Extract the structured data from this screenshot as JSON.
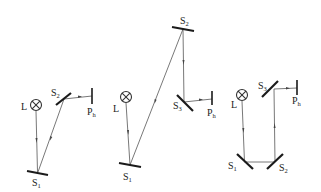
{
  "diagrams": [
    {
      "name": "two-mirror-setup",
      "labels": {
        "lamp": "L",
        "mirrors": [
          {
            "base": "S",
            "sub": "1"
          },
          {
            "base": "S",
            "sub": "2"
          }
        ],
        "detector": {
          "base": "P",
          "sub": "h"
        }
      }
    },
    {
      "name": "three-mirror-long-path-setup",
      "labels": {
        "lamp": "L",
        "mirrors": [
          {
            "base": "S",
            "sub": "1"
          },
          {
            "base": "S",
            "sub": "2"
          },
          {
            "base": "S",
            "sub": "3"
          }
        ],
        "detector": {
          "base": "P",
          "sub": "h"
        }
      }
    },
    {
      "name": "three-mirror-folded-setup",
      "labels": {
        "lamp": "L",
        "mirrors": [
          {
            "base": "S",
            "sub": "1"
          },
          {
            "base": "S",
            "sub": "2"
          },
          {
            "base": "S",
            "sub": "3"
          }
        ],
        "detector": {
          "base": "P",
          "sub": "h"
        }
      }
    }
  ]
}
